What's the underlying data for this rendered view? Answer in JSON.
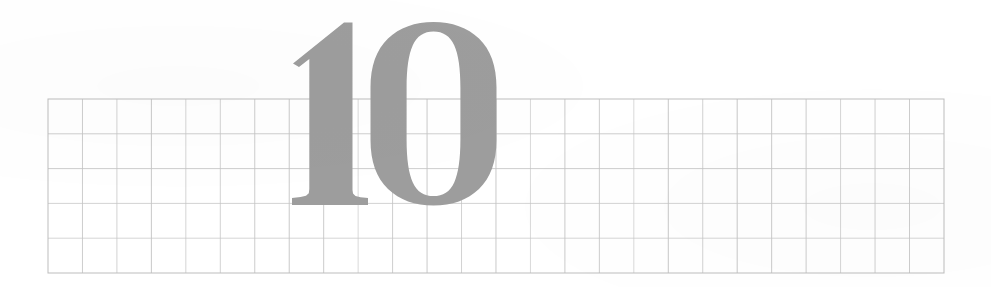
{
  "page": {
    "kind": "scanned-graph-paper-page",
    "width": 991,
    "height": 287,
    "background_color": "#ffffff",
    "caption": "Page number 10 printed over ruled graph paper"
  },
  "page_number": {
    "text": "10",
    "digits": [
      "1",
      "0"
    ],
    "value": 10,
    "color": "#9d9d9d",
    "style": "didone-serif",
    "x": 293,
    "y": 22,
    "width": 202,
    "height": 183,
    "baseline_y": 205
  },
  "grid": {
    "label": "graph-paper-grid",
    "line_color": "#c5c5c5",
    "border_color": "#bdbdbd",
    "line_width": 1,
    "x": 48,
    "y": 99,
    "width": 896,
    "height": 174,
    "columns": 26,
    "rows": 5,
    "cell_width": 34.46,
    "cell_height": 34.8
  },
  "chart_data": {
    "type": "table",
    "xlabel": "",
    "ylabel": "",
    "columns": 26,
    "rows": 5,
    "cell_width": 34.46,
    "cell_height": 34.8,
    "grid": true,
    "legend": "none",
    "values": []
  }
}
